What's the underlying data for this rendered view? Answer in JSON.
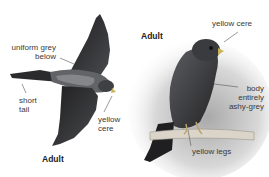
{
  "figure": {
    "left_bird": {
      "caption": "Adult",
      "labels": {
        "uniform_grey": [
          "uniform grey",
          "below"
        ],
        "short_tail": [
          "short",
          "tail"
        ],
        "yellow_cere": [
          "yellow",
          "cere"
        ]
      }
    },
    "right_bird": {
      "caption": "Adult",
      "labels": {
        "yellow_cere": "yellow cere",
        "body": [
          "body",
          "entirely",
          "ashy-grey"
        ],
        "yellow_legs": "yellow legs"
      }
    },
    "colors": {
      "bird_dark": "#2a2a2c",
      "bird_mid": "#55565a",
      "bird_light": "#8a8b8e",
      "perch": "#d9d4c8",
      "shadow": "#c8c8c8"
    }
  }
}
